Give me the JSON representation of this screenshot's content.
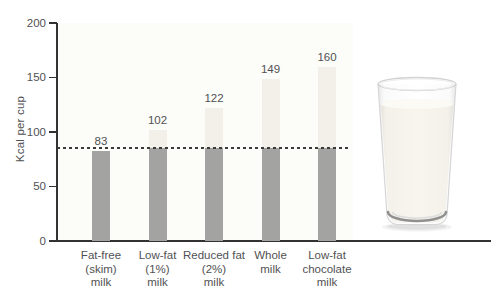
{
  "chart_data": {
    "type": "bar",
    "title": "",
    "xlabel": "",
    "ylabel": "Kcal per cup",
    "ylim": [
      0,
      200
    ],
    "yticks": [
      0,
      50,
      100,
      150,
      200
    ],
    "categories": [
      [
        "Fat-free",
        "(skim)",
        "milk"
      ],
      [
        "Low-fat",
        "(1%)",
        "milk"
      ],
      [
        "Reduced fat",
        "(2%)",
        "milk"
      ],
      [
        "Whole",
        "milk"
      ],
      [
        "Low-fat",
        "chocolate",
        "milk"
      ]
    ],
    "values": [
      83,
      102,
      122,
      149,
      160
    ],
    "value_labels": [
      "83",
      "102",
      "122",
      "149",
      "160"
    ],
    "reference_line": 85,
    "grid": false,
    "legend": null,
    "colors": {
      "bar_below_reference": "#a3a3a1",
      "bar_above_reference": "#f2f0e8",
      "axis": "#323232",
      "reference_line": "#3b3b3b",
      "label_text": "#515153"
    }
  },
  "illustration": {
    "name": "glass-of-milk"
  }
}
